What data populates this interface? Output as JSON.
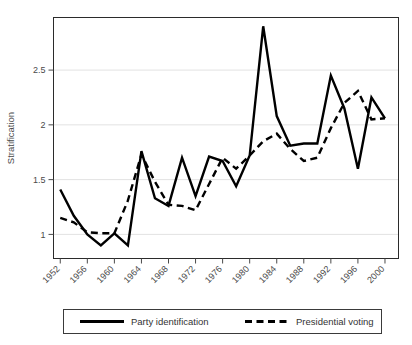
{
  "chart_data": {
    "type": "line",
    "title": "",
    "xlabel": "",
    "ylabel": "Stratification",
    "xlim": [
      1951,
      2002
    ],
    "ylim": [
      0.78,
      2.98
    ],
    "yticks": [
      1,
      1.5,
      2,
      2.5
    ],
    "ytick_labels": [
      "1",
      "1.5",
      "2",
      "2.5"
    ],
    "xticks": [
      1952,
      1956,
      1960,
      1964,
      1968,
      1972,
      1976,
      1980,
      1984,
      1988,
      1992,
      1996,
      2000
    ],
    "xtick_labels": [
      "1952",
      "1956",
      "1960",
      "1964",
      "1968",
      "1972",
      "1976",
      "1980",
      "1984",
      "1988",
      "1992",
      "1996",
      "2000"
    ],
    "grid": true,
    "legend_position": "below",
    "x": [
      1952,
      1954,
      1956,
      1958,
      1960,
      1962,
      1964,
      1966,
      1968,
      1970,
      1972,
      1974,
      1976,
      1978,
      1980,
      1982,
      1984,
      1986,
      1988,
      1990,
      1992,
      1994,
      1996,
      1998,
      2000
    ],
    "series": [
      {
        "name": "Party identification",
        "style": "solid",
        "color": "#000000",
        "values": [
          1.41,
          1.17,
          1.0,
          0.9,
          1.01,
          0.9,
          1.76,
          1.33,
          1.26,
          1.7,
          1.35,
          1.71,
          1.67,
          1.44,
          1.72,
          2.9,
          2.08,
          1.81,
          1.83,
          1.83,
          2.45,
          2.15,
          1.6,
          2.25,
          2.06
        ]
      },
      {
        "name": "Presidential voting",
        "style": "dashed",
        "color": "#000000",
        "values": [
          1.15,
          1.11,
          1.02,
          1.01,
          1.01,
          1.31,
          1.73,
          1.48,
          1.27,
          1.26,
          1.22,
          1.46,
          1.7,
          1.6,
          1.72,
          1.85,
          1.92,
          1.78,
          1.67,
          1.7,
          1.97,
          2.2,
          2.31,
          2.05,
          2.06
        ]
      }
    ]
  },
  "legend": {
    "items": [
      {
        "label": "Party identification",
        "style": "solid"
      },
      {
        "label": "Presidential voting",
        "style": "dashed"
      }
    ]
  }
}
